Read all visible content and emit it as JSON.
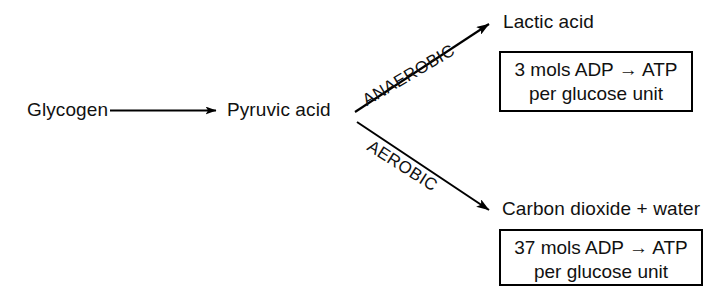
{
  "diagram": {
    "nodes": {
      "start": "Glycogen",
      "intermediate": "Pyruvic acid",
      "anaerobic_product": "Lactic acid",
      "aerobic_product": "Carbon dioxide + water"
    },
    "pathways": {
      "anaerobic_label": "ANAEROBIC",
      "aerobic_label": "AEROBIC"
    },
    "energy_yield": {
      "anaerobic": {
        "line1": "3 mols ADP → ATP",
        "line2": "per glucose unit",
        "mols": 3,
        "reaction": "ADP → ATP",
        "basis": "per glucose unit"
      },
      "aerobic": {
        "line1": "37 mols ADP → ATP",
        "line2": "per glucose unit",
        "mols": 37,
        "reaction": "ADP → ATP",
        "basis": "per glucose unit"
      }
    },
    "colors": {
      "ink": "#000000",
      "background": "#ffffff"
    }
  }
}
